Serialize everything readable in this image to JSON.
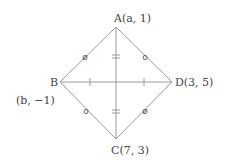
{
  "diagram": {
    "type": "rhombus",
    "vertices": {
      "A": {
        "name": "A",
        "label": "A(a, 1)",
        "x": 116,
        "y": 27
      },
      "B": {
        "name": "B",
        "label": "B",
        "x": 60,
        "y": 82
      },
      "C": {
        "name": "C",
        "label": "C(7, 3)",
        "x": 116,
        "y": 139
      },
      "D": {
        "name": "D",
        "label": "D(3, 5)",
        "x": 172,
        "y": 82
      }
    },
    "b_coord_label": "(b, −1)",
    "diagonals": [
      "AC",
      "BD"
    ],
    "markers": {
      "side_mark_1": "ø",
      "side_mark_2": "o",
      "ac_equal_mark": "=",
      "bd_tick_mark": "|"
    },
    "colors": {
      "line": "#9a9a9a",
      "text": "#444444"
    }
  }
}
